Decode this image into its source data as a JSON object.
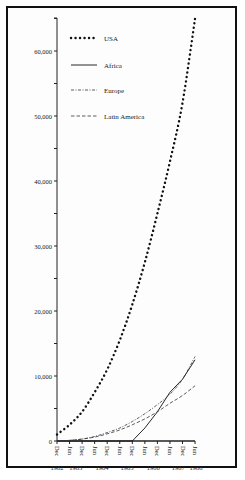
{
  "chart_data": {
    "type": "line",
    "title": "",
    "xlabel": "",
    "ylabel": "",
    "ylim": [
      0,
      65000
    ],
    "yticks": [
      "0",
      "10,000",
      "20,000",
      "30,000",
      "40,000",
      "50,000",
      "60,000"
    ],
    "ytick_values": [
      0,
      10000,
      20000,
      30000,
      40000,
      50000,
      60000
    ],
    "x": [
      "Dec 1982",
      "Jun 1983",
      "Dec 1983",
      "Jun 1984",
      "Dec 1984",
      "Jun 1985",
      "Dec 1985",
      "Jun 1986",
      "Dec 1986",
      "Jun 1987",
      "Dec 1987",
      "Jun 1988"
    ],
    "xtick_months": [
      "Dec",
      "Jun",
      "Dec",
      "Jun",
      "Dec",
      "Jun",
      "Dec",
      "Jun",
      "Dec",
      "Jun",
      "Dec",
      "Jun"
    ],
    "xtick_years": [
      "1982",
      "1983",
      "1984",
      "1985",
      "1986",
      "1987",
      "1988"
    ],
    "grid": false,
    "legend_position": "upper-left",
    "series": [
      {
        "name": "USA",
        "style": "dotted",
        "values": [
          1000,
          2500,
          4500,
          7500,
          11000,
          15500,
          21000,
          27500,
          35000,
          43000,
          52000,
          65000
        ]
      },
      {
        "name": "Africa",
        "style": "solid",
        "values": [
          0,
          0,
          0,
          0,
          0,
          0,
          0,
          2000,
          4500,
          7500,
          9500,
          12500
        ]
      },
      {
        "name": "Europe",
        "style": "dash-dot",
        "values": [
          0,
          100,
          300,
          700,
          1300,
          2000,
          3000,
          4200,
          5600,
          7200,
          9500,
          13000
        ]
      },
      {
        "name": "Latin America",
        "style": "dashed",
        "values": [
          0,
          100,
          300,
          600,
          1100,
          1700,
          2500,
          3400,
          4500,
          5800,
          7000,
          8500
        ]
      }
    ]
  },
  "legend": {
    "usa": "USA",
    "africa": "Africa",
    "europe": "Europe",
    "latin_america": "Latin America"
  }
}
